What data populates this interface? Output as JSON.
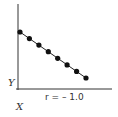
{
  "chart_data": {
    "type": "scatter",
    "title": "",
    "xlabel": "X",
    "ylabel": "Y",
    "annotation": "r = – 1.0",
    "grid": false,
    "legend": null,
    "x": [
      1,
      2,
      3,
      4,
      5,
      6,
      7,
      8
    ],
    "y": [
      8,
      7,
      6,
      5,
      4,
      3,
      2,
      1
    ],
    "trend_line": true,
    "correlation": -1.0
  },
  "labels": {
    "x_axis": "X",
    "y_axis": "Y",
    "annotation": "r = – 1.0"
  },
  "colors": {
    "axis": "#333333",
    "point": "#111111",
    "line": "#222222"
  }
}
